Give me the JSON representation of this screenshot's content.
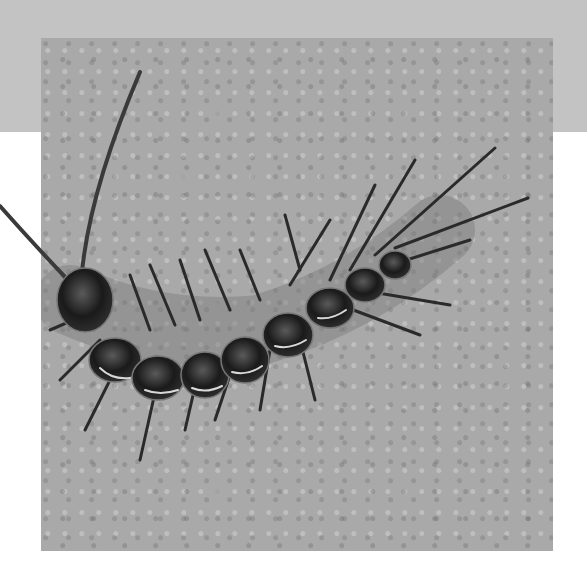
{
  "image": {
    "subject": "centipede on textured concrete surface",
    "description": "Grayscale photograph of a centipede curving across a speckled gray surface, with long antennae and spiny legs; one antenna extends beyond the photo frame.",
    "colors": {
      "background": "#ffffff",
      "top_band": "#c3c3c3",
      "surface": "#a9a9a9",
      "body": "#1c1c1c",
      "highlight": "#d8d8d8"
    }
  }
}
